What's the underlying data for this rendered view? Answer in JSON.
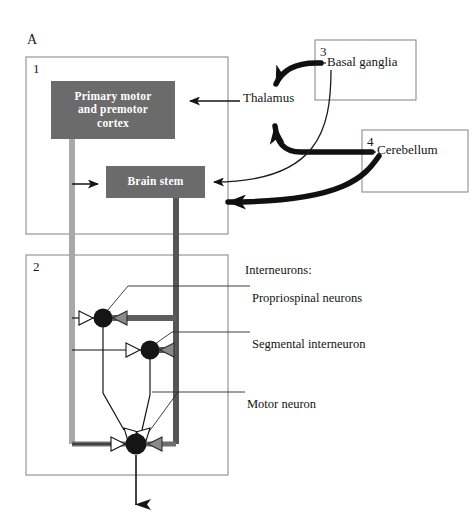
{
  "figure": {
    "panel_letter": "A",
    "background": "#ffffff"
  },
  "panels": [
    {
      "id": "panel-1",
      "number": "1",
      "x": 26,
      "y": 57,
      "w": 202,
      "h": 177
    },
    {
      "id": "panel-2",
      "number": "2",
      "x": 26,
      "y": 255,
      "w": 202,
      "h": 220
    },
    {
      "id": "panel-3",
      "number": "3",
      "x": 315,
      "y": 40,
      "w": 101,
      "h": 60
    },
    {
      "id": "panel-4",
      "number": "4",
      "x": 362,
      "y": 130,
      "w": 106,
      "h": 62
    }
  ],
  "boxes": {
    "cortex": {
      "label": "Primary motor\nand premotor\ncortex",
      "line1": "Primary motor",
      "line2": "and premotor",
      "line3": "cortex",
      "fill": "#6b6b6b",
      "text_color": "#ffffff",
      "x": 51,
      "y": 81,
      "w": 124,
      "h": 58
    },
    "brainstem": {
      "label": "Brain stem",
      "fill": "#6b6b6b",
      "text_color": "#ffffff",
      "x": 106,
      "y": 166,
      "w": 99,
      "h": 32
    }
  },
  "external_labels": {
    "thalamus": {
      "text": "Thalamus",
      "x": 243,
      "y": 98
    },
    "basal_ganglia": {
      "text": "Basal ganglia",
      "x": 327,
      "y": 62
    },
    "cerebellum": {
      "text": "Cerebellum",
      "x": 377,
      "y": 150
    }
  },
  "annotations": {
    "heading": {
      "text": "Interneurons:",
      "x": 245,
      "y": 262
    },
    "items": [
      {
        "text": "Propriospinal neurons",
        "x": 252,
        "y": 290
      },
      {
        "text": "Segmental interneuron",
        "x": 252,
        "y": 336
      },
      {
        "text": "Motor neuron",
        "x": 247,
        "y": 396
      }
    ]
  },
  "neurons": [
    {
      "name": "propriospinal-neuron",
      "cx": 103,
      "cy": 318,
      "r": 9
    },
    {
      "name": "segmental-interneuron",
      "cx": 150,
      "cy": 350,
      "r": 9
    },
    {
      "name": "motor-neuron",
      "cx": 136,
      "cy": 444,
      "r": 10
    }
  ],
  "colors": {
    "box_fill": "#6b6b6b",
    "box_text": "#ffffff",
    "panel_border": "#8d8d8d",
    "cortical_tract": "#b0b0b0",
    "brainstem_tract": "#565656",
    "soma": "#151515",
    "synapse_gray": "#8a8a8a",
    "synapse_white": "#ffffff",
    "ink": "#141414"
  },
  "output": {
    "axon_label": "motor-neuron-output-axon",
    "x": 136,
    "y_from": 455,
    "y_to": 516
  }
}
